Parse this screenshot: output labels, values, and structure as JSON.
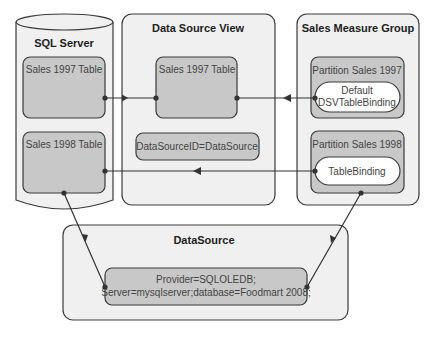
{
  "diagram": {
    "colors": {
      "container_fill": "#f0f0f0",
      "inner_fill": "#c8c8c8",
      "pill_fill": "#ffffff",
      "stroke": "#3a3a3a",
      "text": "#333333"
    },
    "sql_server": {
      "title": "SQL Server",
      "tables": [
        {
          "label": "Sales 1997 Table"
        },
        {
          "label": "Sales 1998 Table"
        }
      ]
    },
    "data_source_view": {
      "title": "Data Source View",
      "table": {
        "label": "Sales 1997 Table"
      },
      "datasource_id": "DataSourceID=DataSource"
    },
    "sales_measure_group": {
      "title": "Sales Measure Group",
      "partitions": [
        {
          "label": "Partition Sales 1997",
          "binding_line1": "Default",
          "binding_line2": "DSVTableBinding"
        },
        {
          "label": "Partition Sales 1998",
          "binding_line1": "TableBinding"
        }
      ]
    },
    "datasource": {
      "title": "DataSource",
      "connection_line1": "Provider=SQLOLEDB;",
      "connection_line2": "Server=mysqlserver;database=Foodmart 2008;"
    }
  }
}
